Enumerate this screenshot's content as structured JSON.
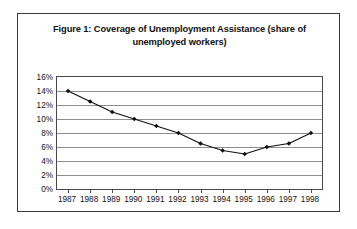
{
  "figure": {
    "title": "Figure 1: Coverage of Unemployment Assistance (share of unemployed workers)"
  },
  "chart_data": {
    "type": "line",
    "title": "Figure 1: Coverage of Unemployment Assistance (share of unemployed workers)",
    "xlabel": "",
    "ylabel": "",
    "categories": [
      "1987",
      "1988",
      "1989",
      "1990",
      "1991",
      "1992",
      "1993",
      "1994",
      "1995",
      "1996",
      "1997",
      "1998"
    ],
    "values": [
      14,
      12.5,
      11,
      10,
      9,
      8,
      6.5,
      5.5,
      5,
      6,
      6.5,
      8
    ],
    "ylim": [
      0,
      16
    ],
    "ytick_labels": [
      "16%",
      "14%",
      "12%",
      "10%",
      "8%",
      "6%",
      "4%",
      "2%",
      "0%"
    ],
    "ytick_values": [
      16,
      14,
      12,
      10,
      8,
      6,
      4,
      2,
      0
    ],
    "ytick_step": 2,
    "grid": true,
    "legend": false,
    "legend_position": "none",
    "marker": "diamond",
    "line_color": "#101010",
    "marker_color": "#101010",
    "gridline_color": "#8d8d8d",
    "border_color": "#3a3a3a"
  }
}
